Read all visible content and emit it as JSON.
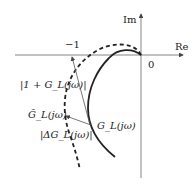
{
  "diagram": {
    "type": "nyquist-plot",
    "axes": {
      "real_label": "Re",
      "imag_label": "Im",
      "origin_label": "0",
      "critical_point_label": "−1"
    },
    "curves": [
      {
        "name": "G_L(jω)",
        "style": "solid",
        "label": "G_L(jω)"
      },
      {
        "name": "G̃_L(jω)",
        "style": "dashed",
        "label": "G̃_L(jω)"
      }
    ],
    "annotations": {
      "return_difference": "|1 + G_L(jω)|",
      "perturbation": "|ΔG_L(jω)|"
    },
    "colors": {
      "line": "#222222",
      "axis": "#555555"
    }
  }
}
